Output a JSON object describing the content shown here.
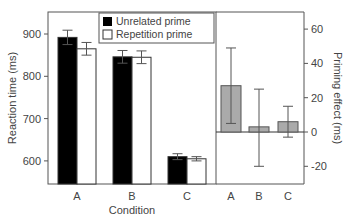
{
  "chart_data": [
    {
      "type": "bar",
      "title": "",
      "xlabel": "Condition",
      "ylabel": "Reaction time (ms)",
      "ylim": [
        550,
        960
      ],
      "yticks": [
        600,
        700,
        800,
        900
      ],
      "categories": [
        "A",
        "B",
        "C"
      ],
      "legend": [
        "Unrelated prime",
        "Repetition prime"
      ],
      "legend_position": "top-right",
      "series": [
        {
          "name": "Unrelated prime",
          "color": "#000000",
          "values": [
            892,
            846,
            610
          ],
          "errors": [
            17,
            15,
            7
          ]
        },
        {
          "name": "Repetition prime",
          "color": "#ffffff",
          "values": [
            865,
            845,
            605
          ],
          "errors": [
            15,
            15,
            5
          ]
        }
      ]
    },
    {
      "type": "bar",
      "title": "",
      "xlabel": "",
      "ylabel": "Priming effect (ms)",
      "ylim": [
        -30,
        70
      ],
      "yticks": [
        -20,
        0,
        20,
        40,
        60
      ],
      "categories": [
        "A",
        "B",
        "C"
      ],
      "series": [
        {
          "name": "Priming effect",
          "color": "#aaaaaa",
          "values": [
            27,
            3,
            6
          ],
          "err_high": [
            49,
            25,
            15
          ],
          "err_low": [
            5,
            -20,
            -3
          ]
        }
      ]
    }
  ],
  "labels": {
    "xlabel": "Condition",
    "ylabel_left": "Reaction time (ms)",
    "ylabel_right": "Priming effect (ms)",
    "legend1": "Unrelated prime",
    "legend2": "Repetition prime",
    "cats": [
      "A",
      "B",
      "C"
    ],
    "lt": [
      "900",
      "800",
      "700",
      "600"
    ],
    "rt": [
      "60",
      "40",
      "20",
      "0",
      "-20"
    ]
  }
}
